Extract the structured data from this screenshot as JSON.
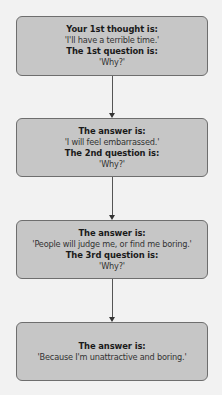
{
  "diagram": {
    "type": "flowchart",
    "steps": [
      {
        "label1": "Your 1st thought is:",
        "text1": "'I'll have a terrible time.'",
        "label2": "The 1st question is:",
        "text2": "'Why?'"
      },
      {
        "label1": "The answer is:",
        "text1": "'I will feel embarrassed.'",
        "label2": "The 2nd question is:",
        "text2": "'Why?'"
      },
      {
        "label1": "The answer is:",
        "text1": "'People will judge me, or find me boring.'",
        "label2": "The 3rd question is:",
        "text2": "'Why?'"
      },
      {
        "label1": "The answer is:",
        "text1": "'Because I'm unattractive and boring.'"
      }
    ],
    "colors": {
      "box_fill": "#c6c6c6",
      "box_border": "#6e6e6e",
      "arrow": "#555555",
      "background": "#f2f2f2"
    }
  }
}
